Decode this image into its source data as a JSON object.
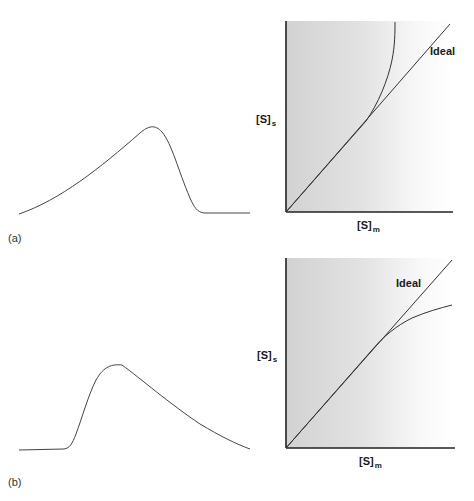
{
  "panels": [
    {
      "id": "a",
      "label": "(a)",
      "peak": {
        "description": "Chromatographic peak with fronting (gradual rise, sharp fall)",
        "shape": "fronting"
      },
      "isotherm": {
        "ylabel_main": "[S]",
        "ylabel_sub": "s",
        "xlabel_main": "[S]",
        "xlabel_sub": "m",
        "ideal_label": "Ideal",
        "curve_deviation": "upward (anti-Langmuir)"
      }
    },
    {
      "id": "b",
      "label": "(b)",
      "peak": {
        "description": "Chromatographic peak with tailing (sharp rise, gradual fall)",
        "shape": "tailing"
      },
      "isotherm": {
        "ylabel_main": "[S]",
        "ylabel_sub": "s",
        "xlabel_main": "[S]",
        "xlabel_sub": "m",
        "ideal_label": "Ideal",
        "curve_deviation": "downward (Langmuir)"
      }
    }
  ],
  "colors": {
    "line": "#333333",
    "axis": "#222222",
    "shade_start": "#d4d4d4",
    "shade_end": "#ffffff"
  }
}
